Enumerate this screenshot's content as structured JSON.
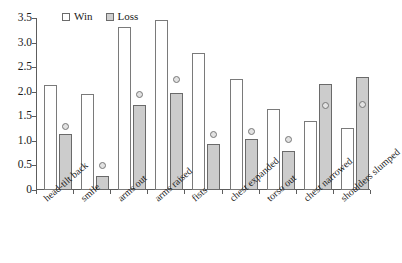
{
  "chart_data": {
    "type": "bar",
    "title": "",
    "xlabel": "",
    "ylabel": "",
    "ylim": [
      0,
      3.5
    ],
    "ytick_step": 0.5,
    "grid": false,
    "legend_position": "top-left",
    "categories": [
      "head-tilt back",
      "smile",
      "arms out",
      "arms raised",
      "fists",
      "chest expanded",
      "torso out",
      "chest narrowed",
      "shoulders slumped"
    ],
    "ytick_labels": [
      "0",
      "0.5",
      "1.0",
      "1.5",
      "2.0",
      "2.5",
      "3.0",
      "3.5"
    ],
    "ytick_values": [
      0,
      0.5,
      1.0,
      1.5,
      2.0,
      2.5,
      3.0,
      3.5
    ],
    "series": [
      {
        "name": "Win",
        "style": "open-bar",
        "values": [
          2.13,
          1.95,
          3.31,
          3.46,
          2.78,
          2.25,
          1.65,
          1.4,
          1.27
        ]
      },
      {
        "name": "Loss",
        "style": "filled-bar",
        "values": [
          1.15,
          0.28,
          1.74,
          1.97,
          0.93,
          1.03,
          0.8,
          2.15,
          2.29
        ]
      },
      {
        "name": "marker",
        "style": "open-circle",
        "values": [
          1.3,
          0.5,
          1.94,
          2.25,
          1.13,
          1.2,
          1.02,
          1.72,
          1.75
        ]
      }
    ],
    "colors": {
      "win_fill": "#ffffff",
      "win_border": "#7a7a7a",
      "loss_fill": "#cccccc",
      "loss_border": "#6a6a6a",
      "marker_fill": "#e2e2e2",
      "marker_border": "#777777",
      "axis": "#5d5d5d",
      "text": "#1a1a1a",
      "background": "#ffffff"
    }
  },
  "legend": {
    "items": [
      {
        "label": "Win",
        "swatch": "open-square"
      },
      {
        "label": "Loss",
        "swatch": "filled-square"
      }
    ]
  }
}
